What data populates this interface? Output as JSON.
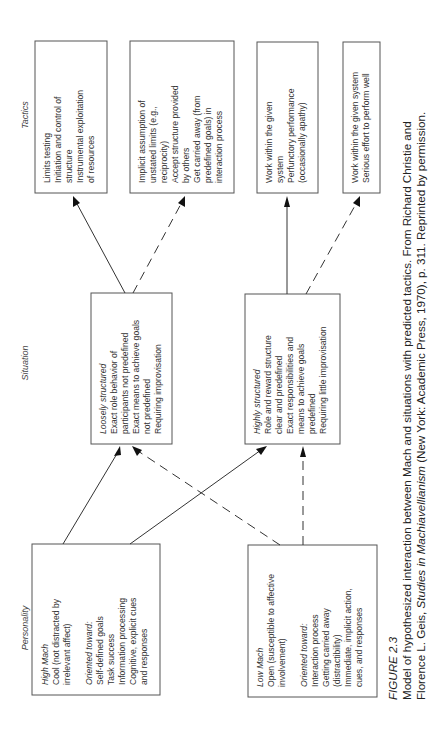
{
  "figure": {
    "section_labels": {
      "personality": "Personality",
      "situation": "Situation",
      "tactics": "Tactics"
    },
    "personality": {
      "high_mach": {
        "title": "High Mach",
        "lines": [
          "Cool (not distracted by",
          "irrelevant affect)"
        ],
        "oriented_label": "Oriented toward:",
        "oriented_lines": [
          "Self-defined goals",
          "Task success",
          "Information processing",
          "Cognitive, explicit cues",
          "and responses"
        ]
      },
      "low_mach": {
        "title": "Low Mach",
        "lines": [
          "Open (susceptible to affective",
          "involvement)"
        ],
        "oriented_label": "Oriented toward:",
        "oriented_lines": [
          "Interaction process",
          "Getting carried away",
          "(distractibility)",
          "Immediate, implicit action,",
          "cues, and responses"
        ]
      }
    },
    "situation": {
      "loosely": {
        "title": "Loosely structured",
        "lines": [
          "Exact role behavior of",
          "participants not predefined",
          "Exact means to achieve goals",
          "not predefined",
          "Requiring improvisation"
        ]
      },
      "highly": {
        "title": "Highly structured",
        "lines": [
          "Role and reward structure",
          "clear and predefined",
          "Exact responsibilities and",
          "means to achieve goals",
          "predefined",
          "Requiring little improvisation"
        ]
      }
    },
    "tactics": [
      {
        "lines": [
          "Limits testing",
          "Initiation and control of",
          "structure",
          "Instrumental exploitation",
          "of resources"
        ]
      },
      {
        "lines": [
          "Implicit assumption of",
          "unstated limits (e.g.,",
          "reciprocity)",
          "Accept structure provided",
          "by others",
          "Get carried away (from",
          "predefined goals) in",
          "interaction process"
        ]
      },
      {
        "lines": [
          "Work within the given",
          "system",
          "Perfunctory performance",
          "(occasionally apathy)"
        ]
      },
      {
        "lines": [
          "Work within the given system",
          "Serious effort to perform well"
        ]
      }
    ],
    "legend": {
      "solid_line": "High Mach path",
      "dashed_line": "Low Mach path"
    }
  },
  "caption": {
    "figure_number": "FIGURE 2.3",
    "line1": "Model of hypothesized interaction between Mach and situations with predicted tactics. From Richard Christie and",
    "line2_pre": "Florence L. Geis, ",
    "line2_title": "Studies in Machiavellianism",
    "line2_post": " (New York: Academic Press, 1970), p. 311. Reprinted by permission."
  }
}
